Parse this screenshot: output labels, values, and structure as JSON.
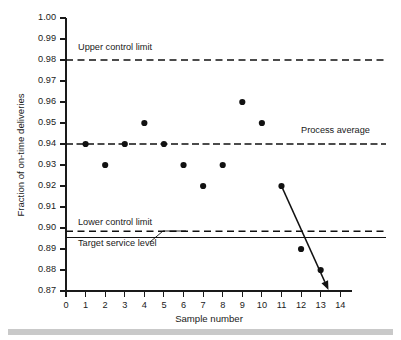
{
  "chart_data": {
    "type": "scatter",
    "title": "",
    "xlabel": "Sample number",
    "ylabel": "Fraction of on-time deliveries",
    "xlim": [
      0,
      14.6
    ],
    "ylim": [
      0.87,
      1.0
    ],
    "grid": false,
    "legend": "none",
    "x_ticks": [
      "0",
      "1",
      "2",
      "3",
      "4",
      "5",
      "6",
      "7",
      "8",
      "9",
      "10",
      "11",
      "12",
      "13",
      "14"
    ],
    "x_tick_values": [
      0,
      1,
      2,
      3,
      4,
      5,
      6,
      7,
      8,
      9,
      10,
      11,
      12,
      13,
      14
    ],
    "y_ticks": [
      "0.87",
      "0.88",
      "0.89",
      "0.90",
      "0.91",
      "0.92",
      "0.93",
      "0.94",
      "0.95",
      "0.96",
      "0.97",
      "0.98",
      "0.99",
      "1.00"
    ],
    "y_tick_values": [
      0.87,
      0.88,
      0.89,
      0.9,
      0.91,
      0.92,
      0.93,
      0.94,
      0.95,
      0.96,
      0.97,
      0.98,
      0.99,
      1.0
    ],
    "x": [
      1,
      2,
      3,
      4,
      5,
      6,
      7,
      8,
      9,
      10,
      11,
      12,
      13
    ],
    "values": [
      0.94,
      0.93,
      0.94,
      0.95,
      0.94,
      0.93,
      0.92,
      0.93,
      0.96,
      0.95,
      0.92,
      0.89,
      0.88
    ],
    "series": [
      {
        "name": "Fraction of on-time deliveries",
        "x": [
          1,
          2,
          3,
          4,
          5,
          6,
          7,
          8,
          9,
          10,
          11,
          12,
          13
        ],
        "values": [
          0.94,
          0.93,
          0.94,
          0.95,
          0.94,
          0.93,
          0.92,
          0.93,
          0.96,
          0.95,
          0.92,
          0.89,
          0.88
        ]
      }
    ],
    "reference_lines": [
      {
        "name": "upper-control-limit",
        "label": "Upper control limit",
        "value": 0.98,
        "style": "dashed"
      },
      {
        "name": "process-average",
        "label": "Process average",
        "value": 0.94,
        "style": "dashdot"
      },
      {
        "name": "lower-control-limit",
        "label": "Lower control limit",
        "value": 0.8985,
        "style": "dashed"
      },
      {
        "name": "target-service-level",
        "label": "Target service level",
        "value": 0.8955,
        "style": "solid"
      }
    ],
    "annotations": [
      {
        "name": "downward-trend-arrow",
        "from_x": 11,
        "from_y": 0.92,
        "to_x": 13.4,
        "to_y": 0.8705,
        "style": "arrow"
      }
    ]
  },
  "labels": {
    "upper_control_limit": "Upper control limit",
    "process_average": "Process average",
    "lower_control_limit": "Lower control limit",
    "target_service_level": "Target service level",
    "x_axis_title": "Sample number",
    "y_axis_title": "Fraction of on-time deliveries"
  },
  "colors": {
    "ink": "#111111",
    "background": "#ffffff",
    "footer_bar": "#c9c9c9"
  }
}
